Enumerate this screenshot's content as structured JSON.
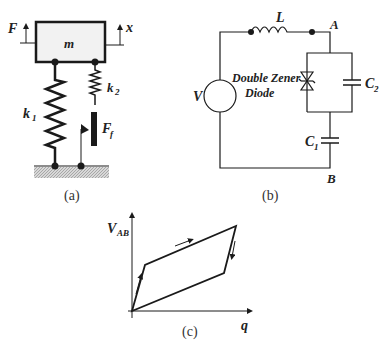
{
  "panel_a": {
    "caption": "(a)",
    "force_label": "F",
    "displacement_label": "x",
    "mass_label": "m",
    "spring1_label": "k",
    "spring1_sub": "1",
    "spring2_label": "k",
    "spring2_sub": "2",
    "friction_label": "F",
    "friction_sub": "f"
  },
  "panel_b": {
    "caption": "(b)",
    "inductor_label": "L",
    "node_a_label": "A",
    "node_b_label": "B",
    "source_label": "V",
    "diode_label_line1": "Double Zener",
    "diode_label_line2": "Diode",
    "cap2_label": "C",
    "cap2_sub": "2",
    "cap1_label": "C",
    "cap1_sub": "1"
  },
  "panel_c": {
    "caption": "(c)",
    "y_axis_label": "V",
    "y_axis_sub": "AB",
    "x_axis_label": "q"
  },
  "colors": {
    "line": "#1a1a1a",
    "mass_fill": "#f2f2f2",
    "ground_hatch": "#bdbdbd"
  }
}
